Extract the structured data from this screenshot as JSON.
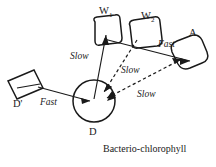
{
  "figure": {
    "caption": "Bacterio-chlorophyll",
    "background_color": "#ffffff",
    "ink_color": "#1a1a1a"
  },
  "nodes": [
    {
      "id": "w1",
      "label": "W",
      "subscript": "1",
      "shape": "rounded-rectangle",
      "label_x": 101,
      "label_y": 12
    },
    {
      "id": "w2",
      "label": "W",
      "subscript": "2",
      "shape": "rounded-square",
      "label_x": 143,
      "label_y": 17
    },
    {
      "id": "a",
      "label": "A",
      "subscript": "",
      "shape": "rounded-blob",
      "label_x": 190,
      "label_y": 35
    },
    {
      "id": "d",
      "label": "D",
      "subscript": "",
      "shape": "circle",
      "label_x": 88,
      "label_y": 133
    },
    {
      "id": "dprime",
      "label": "D'",
      "subscript": "",
      "shape": "tilted-rectangle",
      "label_x": 17,
      "label_y": 104
    }
  ],
  "edges": [
    {
      "id": "dprime-to-d",
      "from": "dprime",
      "to": "d",
      "style": "solid",
      "label": "Fast",
      "label_x": 42,
      "label_y": 103
    },
    {
      "id": "d-to-w1",
      "from": "d",
      "to": "w1",
      "style": "solid",
      "label": "Slow",
      "label_x": 72,
      "label_y": 57
    },
    {
      "id": "w2-to-d",
      "from": "w2",
      "to": "d",
      "style": "dashed",
      "label": "Slow",
      "label_x": 123,
      "label_y": 72
    },
    {
      "id": "d-to-a",
      "from": "d",
      "to": "a",
      "style": "dashed",
      "label": "Slow",
      "label_x": 138,
      "label_y": 96
    },
    {
      "id": "w-to-a",
      "from": "w2",
      "to": "a",
      "style": "solid",
      "label": "Fast",
      "label_x": 160,
      "label_y": 45
    }
  ],
  "caption": {
    "text": "Bacterio-chlorophyll",
    "x": 104,
    "y": 150
  }
}
